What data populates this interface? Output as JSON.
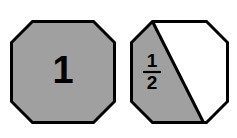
{
  "canvas": {
    "width": 237,
    "height": 138,
    "background_color": "#ffffff"
  },
  "style": {
    "shaded_fill": "#a0a0a0",
    "unshaded_fill": "#ffffff",
    "outline_color": "#000000",
    "outline_width": 3,
    "divider_color": "#000000",
    "divider_width": 3,
    "label_color": "#000000"
  },
  "figures": [
    {
      "id": "octagon-whole",
      "shape": "octagon",
      "label": "1",
      "label_kind": "integer",
      "parts_total": 1,
      "parts_shaded": 1,
      "fraction_shaded": 1,
      "divided": false,
      "center": {
        "x": 63,
        "y": 72
      },
      "radius": 53
    },
    {
      "id": "octagon-half",
      "shape": "octagon",
      "label_numerator": "1",
      "label_denominator": "2",
      "label_kind": "fraction",
      "parts_total": 2,
      "parts_shaded": 1,
      "fraction_shaded": 0.5,
      "divided": true,
      "divider": "diagonal from top-edge-left-vertex to bottom-edge-right-vertex",
      "center": {
        "x": 177,
        "y": 72
      },
      "radius": 53
    }
  ]
}
